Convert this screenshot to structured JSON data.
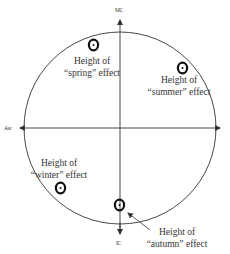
{
  "diagram": {
    "axes": {
      "top": "MC",
      "left": "Asc",
      "bottom": "IC"
    },
    "symbol": "sun-glyph",
    "effects": [
      {
        "key": "spring",
        "line1": "Height of",
        "line2": "“spring” effect"
      },
      {
        "key": "summer",
        "line1": "Height of",
        "line2": "“summer” effect"
      },
      {
        "key": "winter",
        "line1": "Height of",
        "line2": "“winter” effect"
      },
      {
        "key": "autumn",
        "line1": "Height of",
        "line2": "“autumn” effect"
      }
    ],
    "colors": {
      "line": "#333333",
      "symbol": "#111111"
    }
  }
}
